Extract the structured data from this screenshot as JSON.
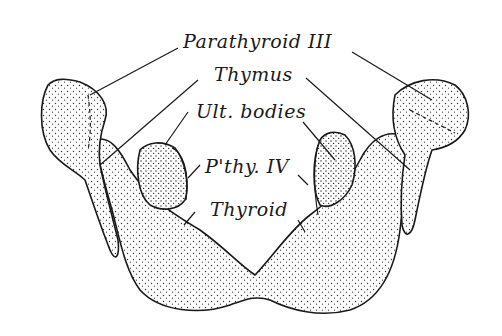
{
  "figure": {
    "labels": {
      "parathyroid_iii": "Parathyroid III",
      "thymus": "Thymus",
      "ult_bodies": "Ult. bodies",
      "pthy_iv": "P'thy. IV",
      "thyroid": "Thyroid"
    },
    "colors": {
      "ink": "#1a1a1a",
      "fill": "#f4f4f4",
      "background": "#ffffff"
    }
  }
}
